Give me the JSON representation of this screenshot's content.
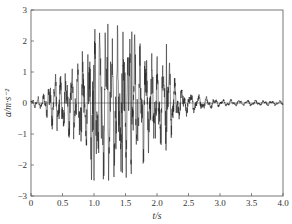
{
  "chart_data": {
    "type": "line",
    "title": "",
    "xlabel": "t/s",
    "ylabel": "a/m·s⁻²",
    "xlim": [
      0,
      4.0
    ],
    "ylim": [
      -3,
      3
    ],
    "x_ticks": [
      "0",
      "0.5",
      "1.0",
      "1.5",
      "2.0",
      "2.5",
      "3.0",
      "3.5",
      "4.0"
    ],
    "y_ticks": [
      "3",
      "2",
      "1",
      "0",
      "-1",
      "-2",
      "-3"
    ],
    "grid": false,
    "legend": null,
    "series": [
      {
        "name": "acceleration time history",
        "color": "#222222",
        "description": "Seismic-like acceleration record: small amplitude near 0 s, strong shaking 0.5–2.2 s, decaying to small oscillations after ~2.5 s",
        "envelope": [
          {
            "t": 0.0,
            "amp": 0.1
          },
          {
            "t": 0.2,
            "amp": 0.3
          },
          {
            "t": 0.35,
            "amp": 0.9
          },
          {
            "t": 0.6,
            "amp": 1.1
          },
          {
            "t": 0.8,
            "amp": 1.6
          },
          {
            "t": 1.0,
            "amp": 2.7
          },
          {
            "t": 1.2,
            "amp": 2.5
          },
          {
            "t": 1.45,
            "amp": 2.5
          },
          {
            "t": 1.65,
            "amp": 2.2
          },
          {
            "t": 1.85,
            "amp": 1.8
          },
          {
            "t": 2.0,
            "amp": 1.5
          },
          {
            "t": 2.15,
            "amp": 1.6
          },
          {
            "t": 2.3,
            "amp": 0.7
          },
          {
            "t": 2.5,
            "amp": 0.4
          },
          {
            "t": 2.7,
            "amp": 0.25
          },
          {
            "t": 3.0,
            "amp": 0.12
          },
          {
            "t": 4.0,
            "amp": 0.08
          }
        ],
        "notable_points": [
          {
            "t": 1.0,
            "a": 2.7
          },
          {
            "t": 1.22,
            "a": 2.55
          },
          {
            "t": 1.6,
            "a": 2.3
          },
          {
            "t": 2.15,
            "a": 1.9
          },
          {
            "t": 1.0,
            "a": -2.5
          },
          {
            "t": 1.45,
            "a": -2.25
          },
          {
            "t": 1.78,
            "a": -1.95
          }
        ]
      }
    ]
  }
}
